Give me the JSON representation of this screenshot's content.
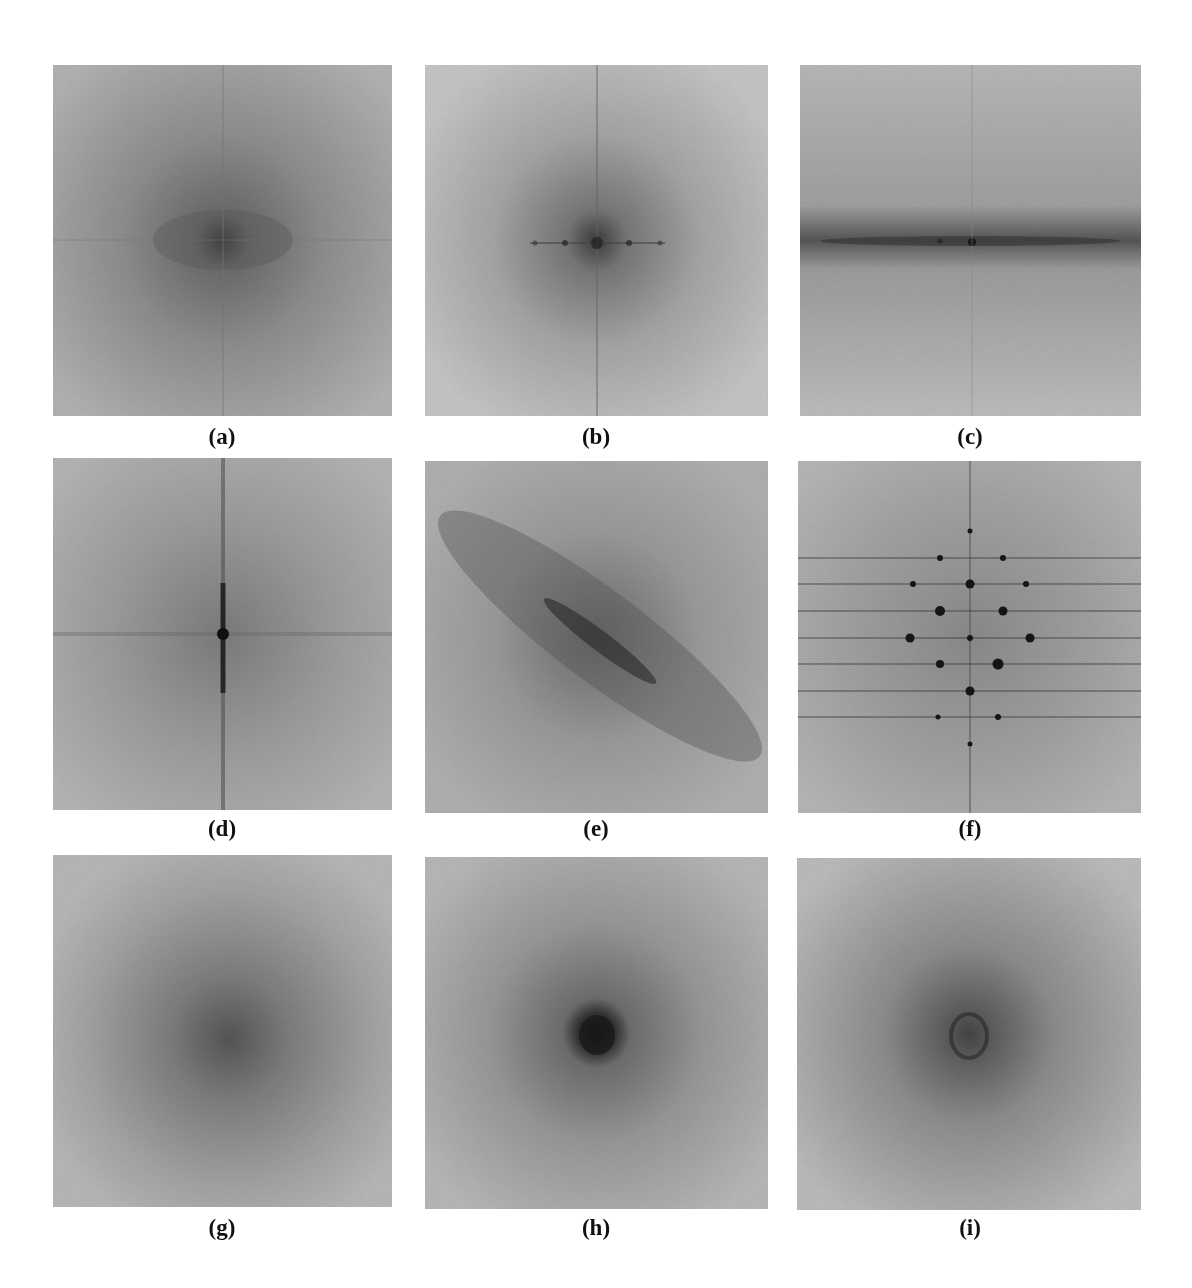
{
  "figure": {
    "layout": {
      "rows": 3,
      "cols": 3
    },
    "panels": [
      {
        "id": "a",
        "label": "(a)",
        "description": "Isotropic spectrum with dark diffuse center and faint horizontal/vertical axis lines",
        "pattern": "isotropic-center"
      },
      {
        "id": "b",
        "label": "(b)",
        "description": "Spectrum with dark center, thin vertical line, and discrete horizontal peaks along center row",
        "pattern": "center-with-horizontal-peaks"
      },
      {
        "id": "c",
        "label": "(c)",
        "description": "Strong horizontal dark band through center",
        "pattern": "horizontal-band"
      },
      {
        "id": "d",
        "label": "(d)",
        "description": "Strong vertical dark line with periodic peaks and faint horizontal line",
        "pattern": "vertical-line"
      },
      {
        "id": "e",
        "label": "(e)",
        "description": "Diagonal dark band from upper-left to lower-right",
        "pattern": "diagonal-band"
      },
      {
        "id": "f",
        "label": "(f)",
        "description": "Lattice of discrete dark peaks on horizontal rows and vertical axis",
        "pattern": "lattice-peaks"
      },
      {
        "id": "g",
        "label": "(g)",
        "description": "Broad isotropic diffuse dark center",
        "pattern": "isotropic-broad"
      },
      {
        "id": "h",
        "label": "(h)",
        "description": "Compact very dark central blob",
        "pattern": "compact-center"
      },
      {
        "id": "i",
        "label": "(i)",
        "description": "Dark center with faint ring-like structure",
        "pattern": "ring-center"
      }
    ]
  }
}
